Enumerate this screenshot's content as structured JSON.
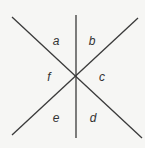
{
  "diagram": {
    "type": "intersecting-lines",
    "line_color": "#3a3a3a",
    "background": "#f6f6f4",
    "center": [
      76,
      76
    ],
    "lines": [
      {
        "name": "vertical-line",
        "x1": 76,
        "y1": 15,
        "x2": 76,
        "y2": 138
      },
      {
        "name": "descending-diagonal-line",
        "x1": 12,
        "y1": 17,
        "x2": 142,
        "y2": 138
      },
      {
        "name": "ascending-diagonal-line",
        "x1": 138,
        "y1": 18,
        "x2": 12,
        "y2": 135
      }
    ],
    "angle_labels": [
      {
        "id": "a",
        "text": "a",
        "x": 56,
        "y": 41
      },
      {
        "id": "b",
        "text": "b",
        "x": 92,
        "y": 41
      },
      {
        "id": "c",
        "text": "c",
        "x": 102,
        "y": 77
      },
      {
        "id": "d",
        "text": "d",
        "x": 93,
        "y": 118
      },
      {
        "id": "e",
        "text": "e",
        "x": 56,
        "y": 118
      },
      {
        "id": "f",
        "text": "f",
        "x": 49,
        "y": 77
      }
    ]
  }
}
